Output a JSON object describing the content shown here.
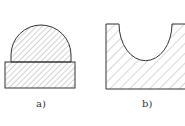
{
  "figures": [
    {
      "id": "a",
      "label": "a)",
      "description": "semicircular dome on rectangular base, both hatched"
    },
    {
      "id": "b",
      "label": "b)",
      "description": "block with semicircular U-shaped cutout, hatched"
    }
  ],
  "colors": {
    "stroke": "#333333",
    "hatch": "#555555",
    "background": "#ffffff"
  }
}
